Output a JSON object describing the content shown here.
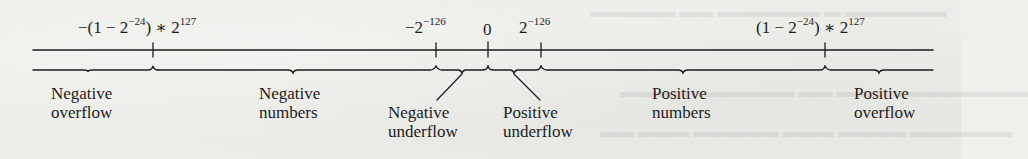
{
  "diagram": {
    "axis_markers": [
      {
        "id": "neg-max",
        "base": "−(1 − 2",
        "exp1": "−24",
        "mid": ") ∗ 2",
        "exp2": "127",
        "x": 153
      },
      {
        "id": "neg-min",
        "base": "−2",
        "exp1": "−126",
        "x": 436
      },
      {
        "id": "zero",
        "base": "0",
        "x": 488
      },
      {
        "id": "pos-min",
        "base": "2",
        "exp1": "−126",
        "x": 541
      },
      {
        "id": "pos-max",
        "base": "(1 − 2",
        "exp1": "−24",
        "mid": ") ∗ 2",
        "exp2": "127",
        "x": 825
      }
    ],
    "regions": {
      "negative_overflow": {
        "line1": "Negative",
        "line2": "overflow"
      },
      "negative_numbers": {
        "line1": "Negative",
        "line2": "numbers"
      },
      "negative_underflow": {
        "line1": "Negative",
        "line2": "underflow"
      },
      "positive_underflow": {
        "line1": "Positive",
        "line2": "underflow"
      },
      "positive_numbers": {
        "line1": "Positive",
        "line2": "numbers"
      },
      "positive_overflow": {
        "line1": "Positive",
        "line2": "overflow"
      }
    },
    "colors": {
      "ink": "#1c1c1c",
      "paper": "#ecece8"
    }
  }
}
